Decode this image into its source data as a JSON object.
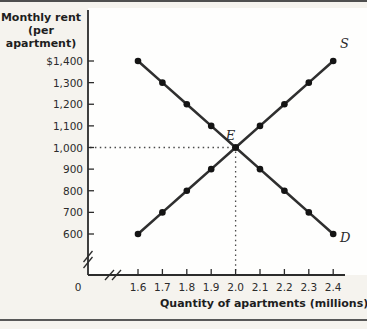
{
  "chart_data": {
    "type": "line",
    "title": "",
    "x_axis": {
      "label": "Quantity of apartments (millions)",
      "origin_label": "0",
      "broken_axis": true,
      "ticks": [
        {
          "label": "1.6",
          "value": 1.6
        },
        {
          "label": "1.7",
          "value": 1.7
        },
        {
          "label": "1.8",
          "value": 1.8
        },
        {
          "label": "1.9",
          "value": 1.9
        },
        {
          "label": "2.0",
          "value": 2.0
        },
        {
          "label": "2.1",
          "value": 2.1
        },
        {
          "label": "2.2",
          "value": 2.2
        },
        {
          "label": "2.3",
          "value": 2.3
        },
        {
          "label": "2.4",
          "value": 2.4
        }
      ],
      "range": [
        1.6,
        2.4
      ]
    },
    "y_axis": {
      "title_line1": "Monthly rent",
      "title_line2": "(per apartment)",
      "broken_axis": true,
      "ticks": [
        {
          "label": "$1,400",
          "value": 1400
        },
        {
          "label": "1,300",
          "value": 1300
        },
        {
          "label": "1,200",
          "value": 1200
        },
        {
          "label": "1,100",
          "value": 1100
        },
        {
          "label": "1,000",
          "value": 1000
        },
        {
          "label": "900",
          "value": 900
        },
        {
          "label": "800",
          "value": 800
        },
        {
          "label": "700",
          "value": 700
        },
        {
          "label": "600",
          "value": 600
        }
      ],
      "range": [
        600,
        1400
      ]
    },
    "series": [
      {
        "name": "supply",
        "label": "S",
        "points": [
          [
            1.6,
            600
          ],
          [
            1.7,
            700
          ],
          [
            1.8,
            800
          ],
          [
            1.9,
            900
          ],
          [
            2.0,
            1000
          ],
          [
            2.1,
            1100
          ],
          [
            2.2,
            1200
          ],
          [
            2.3,
            1300
          ],
          [
            2.4,
            1400
          ]
        ]
      },
      {
        "name": "demand",
        "label": "D",
        "points": [
          [
            1.6,
            1400
          ],
          [
            1.7,
            1300
          ],
          [
            1.8,
            1200
          ],
          [
            1.9,
            1100
          ],
          [
            2.0,
            1000
          ],
          [
            2.1,
            900
          ],
          [
            2.2,
            800
          ],
          [
            2.3,
            700
          ],
          [
            2.4,
            600
          ]
        ]
      }
    ],
    "equilibrium": {
      "label": "E",
      "x": 2.0,
      "y": 1000,
      "dotted_guides": true
    },
    "legend_position": "inline-curve-labels",
    "grid": false,
    "colors": {
      "line": "#2f2f2f",
      "dot": "#141414",
      "axis": "#2b2b2b",
      "guide": "#4a4a4a",
      "text": "#2b2b2b",
      "background": "#f5f3ee",
      "plot_background": "#fefefd"
    }
  }
}
